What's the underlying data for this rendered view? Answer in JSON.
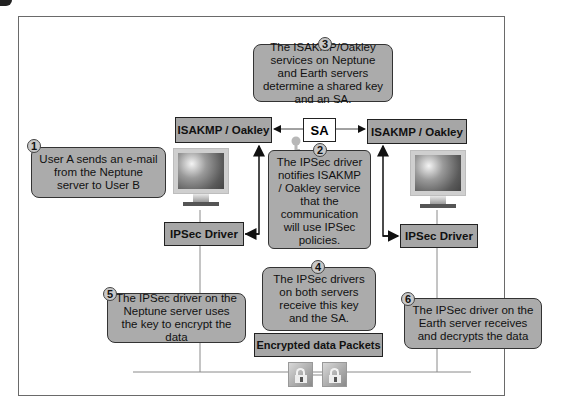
{
  "diagram": {
    "steps": [
      {
        "number": "1",
        "text": "User A sends an e-mail from the Neptune server to User B"
      },
      {
        "number": "2",
        "text": "The IPSec driver notifies ISAKMP / Oakley service that the communication will use IPSec policies."
      },
      {
        "number": "3",
        "text": "The ISAKMP/Oakley services on Neptune and Earth servers determine a shared key and an SA."
      },
      {
        "number": "4",
        "text": "The IPSec drivers on both servers receive this key and the SA."
      },
      {
        "number": "5",
        "text": "The IPSec driver on the Neptune server uses the key to encrypt the data"
      },
      {
        "number": "6",
        "text": "The IPSec driver on the Earth server receives and decrypts the data"
      }
    ],
    "nodes": {
      "isakmp_left": "ISAKMP / Oakley",
      "isakmp_right": "ISAKMP / Oakley",
      "sa": "SA",
      "driver_left": "IPSec Driver",
      "driver_right": "IPSec Driver",
      "packets": "Encrypted data Packets"
    },
    "icons": {
      "monitor_left": "monitor-icon",
      "monitor_right": "monitor-icon",
      "key": "key-icon",
      "lock_1": "lock-icon",
      "lock_2": "lock-icon"
    },
    "colors": {
      "box_fill": "#a6a6a6",
      "callout_fill": "#ababab",
      "border": "#222222",
      "line": "#8a8a8a"
    }
  }
}
